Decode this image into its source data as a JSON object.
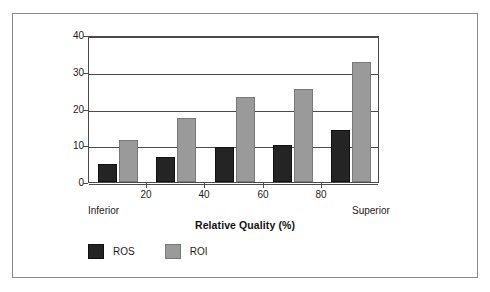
{
  "chart_data": {
    "type": "bar",
    "title": "",
    "xlabel": "Relative Quality (%)",
    "ylabel": "",
    "grid": true,
    "legend_position": "bottom-left",
    "ylim": [
      0,
      40
    ],
    "yticks": [
      0,
      10,
      20,
      30,
      40
    ],
    "ytick_labels": [
      "0",
      "10",
      "20",
      "30",
      "40"
    ],
    "xlim": [
      0,
      100
    ],
    "xticks": [
      20,
      40,
      60,
      80
    ],
    "xtick_labels": [
      "20",
      "40",
      "60",
      "80"
    ],
    "x_axis_endpoints": {
      "left": "Inferior",
      "right": "Superior"
    },
    "categories": [
      "0-20",
      "20-40",
      "40-60",
      "60-80",
      "80-100"
    ],
    "series": [
      {
        "name": "ROS",
        "color": "#242424",
        "values": [
          4.9,
          6.8,
          9.6,
          10.2,
          14.1
        ]
      },
      {
        "name": "ROI",
        "color": "#9a9a9a",
        "values": [
          11.4,
          17.3,
          23.0,
          25.3,
          32.6
        ]
      }
    ]
  },
  "legend": {
    "items": [
      {
        "label": "ROS",
        "swatch": "ros"
      },
      {
        "label": "ROI",
        "swatch": "roi"
      }
    ]
  },
  "colors": {
    "ros_bar": "#242424",
    "roi_bar": "#9a9a9a",
    "axis": "#4a4a4a",
    "frame": "#8a8a8a",
    "text": "#1c1c1c",
    "background": "#ffffff"
  }
}
